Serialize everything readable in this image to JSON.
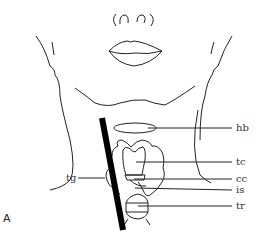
{
  "figure": {
    "panel_label": "A",
    "labels": {
      "hb": "hb",
      "tc": "tc",
      "cc": "cc",
      "is": "is",
      "tr": "tr",
      "tg": "tg"
    }
  }
}
